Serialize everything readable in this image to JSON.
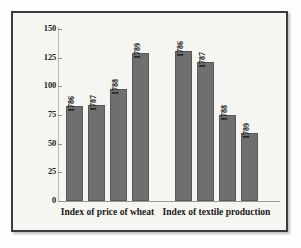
{
  "chart_data": {
    "type": "bar",
    "title": "",
    "subtitle": "",
    "xlabel": "",
    "ylabel": "",
    "ylim": [
      0,
      150
    ],
    "ytick_values": [
      150,
      125,
      100,
      75,
      50,
      25,
      0
    ],
    "ytick_labels": [
      "150",
      "125",
      "100",
      "75",
      "50",
      "25",
      "0"
    ],
    "grid": false,
    "legend": "none",
    "bar_color": "#6f6f6f",
    "bar_border_color": "#5a5a5a",
    "background_color": "#f5f5f1",
    "frame_color": "#3b3b3b",
    "groups": [
      {
        "name": "Index of price of wheat",
        "categories": [
          "1786",
          "1787",
          "1788",
          "1789"
        ],
        "values": [
          83,
          84,
          98,
          129
        ]
      },
      {
        "name": "Index of textile production",
        "categories": [
          "1786",
          "1787",
          "1788",
          "1789"
        ],
        "values": [
          131,
          121,
          75,
          59
        ]
      }
    ]
  },
  "axis": {
    "ticks": [
      {
        "label": "150",
        "value": 150
      },
      {
        "label": "125",
        "value": 125
      },
      {
        "label": "100",
        "value": 100
      },
      {
        "label": "75",
        "value": 75
      },
      {
        "label": "50",
        "value": 50
      },
      {
        "label": "25",
        "value": 25
      },
      {
        "label": "0",
        "value": 0
      }
    ]
  },
  "captions": {
    "group1": "Index of price of wheat",
    "group2": "Index of textile production"
  },
  "bars": [
    {
      "label": "1786",
      "value": 83,
      "group": 1
    },
    {
      "label": "1787",
      "value": 84,
      "group": 1
    },
    {
      "label": "1788",
      "value": 98,
      "group": 1
    },
    {
      "label": "1789",
      "value": 129,
      "group": 1
    },
    {
      "label": "1786",
      "value": 131,
      "group": 2
    },
    {
      "label": "1787",
      "value": 121,
      "group": 2
    },
    {
      "label": "1788",
      "value": 75,
      "group": 2
    },
    {
      "label": "1789",
      "value": 59,
      "group": 2
    }
  ]
}
